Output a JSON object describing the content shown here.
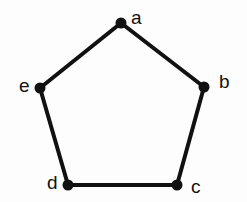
{
  "figure": {
    "kind": "graph-diagram",
    "background_color": "#fdfdfd",
    "stroke_color": "#111111",
    "vertex_fill_color": "#111111",
    "edge_width": 4,
    "vertex_radius": 5.5,
    "canvas": {
      "width": 247,
      "height": 202
    }
  },
  "chart_data": {
    "type": "diagram",
    "title": "",
    "shape": "pentagon",
    "nodes": [
      {
        "id": "a",
        "label": "a",
        "x": 121,
        "y": 23,
        "label_x": 131,
        "label_y": 8,
        "label_align": "right-of-node"
      },
      {
        "id": "b",
        "label": "b",
        "x": 204,
        "y": 87,
        "label_x": 219,
        "label_y": 72,
        "label_align": "right-of-node"
      },
      {
        "id": "c",
        "label": "c",
        "x": 177,
        "y": 185,
        "label_x": 191,
        "label_y": 177,
        "label_align": "right-of-node"
      },
      {
        "id": "d",
        "label": "d",
        "x": 68,
        "y": 185,
        "label_x": 47,
        "label_y": 173,
        "label_align": "left-of-node"
      },
      {
        "id": "e",
        "label": "e",
        "x": 40,
        "y": 88,
        "label_x": 19,
        "label_y": 76,
        "label_align": "left-of-node"
      }
    ],
    "edges": [
      {
        "from": "a",
        "to": "b"
      },
      {
        "from": "b",
        "to": "c"
      },
      {
        "from": "c",
        "to": "d"
      },
      {
        "from": "d",
        "to": "e"
      },
      {
        "from": "e",
        "to": "a"
      }
    ]
  }
}
